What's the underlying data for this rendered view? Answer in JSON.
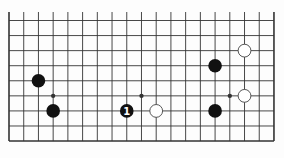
{
  "diagram": {
    "type": "go-board-partial",
    "columns": 19,
    "rows_shown": 9,
    "edges": {
      "left": true,
      "right": true,
      "bottom": true,
      "top": false
    },
    "grid": {
      "x0": 9,
      "dx": 14.72,
      "y0": 20.5,
      "dy": 15.07,
      "line_top": 12
    },
    "colors": {
      "background": "#fdfdfd",
      "line": "#333333",
      "black_stone": "#111111",
      "white_stone": "#ffffff",
      "white_stone_border": "#444444",
      "label_on_black": "#ffffff"
    },
    "star_points": [
      {
        "col": 3,
        "row": 5
      },
      {
        "col": 9,
        "row": 5
      },
      {
        "col": 15,
        "row": 5
      }
    ],
    "stones": [
      {
        "color": "black",
        "col": 2,
        "row": 4,
        "label": ""
      },
      {
        "color": "black",
        "col": 3,
        "row": 6,
        "label": ""
      },
      {
        "color": "black",
        "col": 8,
        "row": 6,
        "label": "1"
      },
      {
        "color": "white",
        "col": 10,
        "row": 6,
        "label": ""
      },
      {
        "color": "white",
        "col": 16,
        "row": 2,
        "label": ""
      },
      {
        "color": "black",
        "col": 14,
        "row": 3,
        "label": ""
      },
      {
        "color": "white",
        "col": 16,
        "row": 5,
        "label": ""
      },
      {
        "color": "black",
        "col": 14,
        "row": 6,
        "label": ""
      }
    ]
  }
}
